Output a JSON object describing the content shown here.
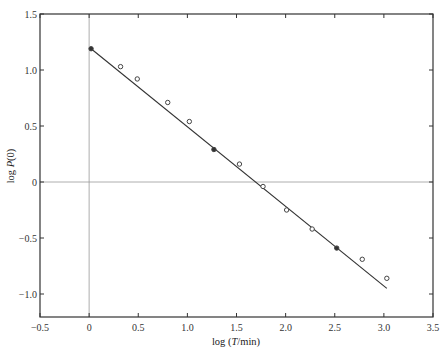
{
  "chart_data": {
    "type": "scatter",
    "title": "",
    "xlabel": "log (T/min)",
    "ylabel": "log P(0)",
    "xlim": [
      -0.5,
      3.5
    ],
    "ylim": [
      -1.22,
      1.5
    ],
    "xticks": [
      -0.5,
      0,
      0.5,
      1.0,
      1.5,
      2.0,
      2.5,
      3.0,
      3.5
    ],
    "xtick_labels": [
      "-0.5",
      "0",
      "0.5",
      "1.0",
      "1.5",
      "2.0",
      "2.5",
      "3.0",
      "3.5"
    ],
    "yticks": [
      1.5,
      1.0,
      0.5,
      0,
      -0.5,
      -1.0
    ],
    "ytick_labels": [
      "1.5",
      "1.0",
      "0.5",
      "0",
      "-0.5",
      "-1.0"
    ],
    "grid": false,
    "reference_lines": {
      "x_zero": true,
      "y_zero": true
    },
    "series": [
      {
        "name": "data points",
        "marker": "open-circle",
        "points": [
          {
            "x": 0.02,
            "y": 1.19,
            "filled": true
          },
          {
            "x": 0.32,
            "y": 1.03,
            "filled": false
          },
          {
            "x": 0.49,
            "y": 0.92,
            "filled": false
          },
          {
            "x": 0.8,
            "y": 0.71,
            "filled": false
          },
          {
            "x": 1.02,
            "y": 0.54,
            "filled": false
          },
          {
            "x": 1.27,
            "y": 0.29,
            "filled": true
          },
          {
            "x": 1.53,
            "y": 0.16,
            "filled": false
          },
          {
            "x": 1.77,
            "y": -0.04,
            "filled": false
          },
          {
            "x": 2.01,
            "y": -0.25,
            "filled": false
          },
          {
            "x": 2.27,
            "y": -0.42,
            "filled": false
          },
          {
            "x": 2.52,
            "y": -0.59,
            "filled": true
          },
          {
            "x": 2.78,
            "y": -0.69,
            "filled": false
          },
          {
            "x": 3.03,
            "y": -0.86,
            "filled": false
          }
        ]
      },
      {
        "name": "linear fit",
        "type": "line",
        "x": [
          0.02,
          3.03
        ],
        "y": [
          1.19,
          -0.95
        ]
      }
    ],
    "legend": null
  },
  "axes": {
    "xlabel_prefix": "log (",
    "xlabel_var": "T",
    "xlabel_suffix": "/min)",
    "ylabel_prefix": "log ",
    "ylabel_var": "P",
    "ylabel_suffix": "(0)"
  }
}
